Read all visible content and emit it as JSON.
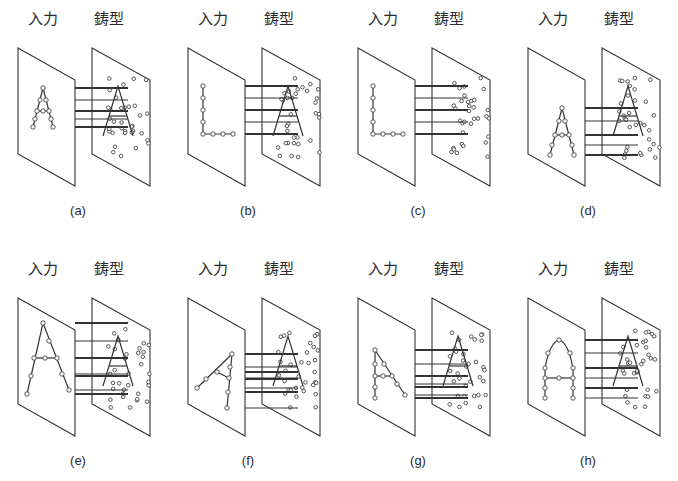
{
  "figure": {
    "input_label": "入力",
    "template_label": "鋳型",
    "panels": [
      {
        "id": "a",
        "caption": "(a)",
        "input_shape": "A",
        "description": "Input 'A' matches template 'A'"
      },
      {
        "id": "b",
        "caption": "(b)",
        "input_shape": "L",
        "description": "Input 'L' partially matches template 'A'"
      },
      {
        "id": "c",
        "caption": "(c)",
        "input_shape": "L",
        "description": "Input 'L' against template with no 'A' pattern"
      },
      {
        "id": "d",
        "caption": "(d)",
        "input_shape": "A-shifted-down",
        "description": "Input 'A' displaced downward"
      },
      {
        "id": "e",
        "caption": "(e)",
        "input_shape": "A-large",
        "description": "Input 'A' enlarged"
      },
      {
        "id": "f",
        "caption": "(f)",
        "input_shape": "A-rotated",
        "description": "Input 'A' rotated"
      },
      {
        "id": "g",
        "caption": "(g)",
        "input_shape": "A-distorted",
        "description": "Input 'A' distorted (one leg vertical)"
      },
      {
        "id": "h",
        "caption": "(h)",
        "input_shape": "A-rounded",
        "description": "Input 'A' with rounded top"
      }
    ]
  }
}
